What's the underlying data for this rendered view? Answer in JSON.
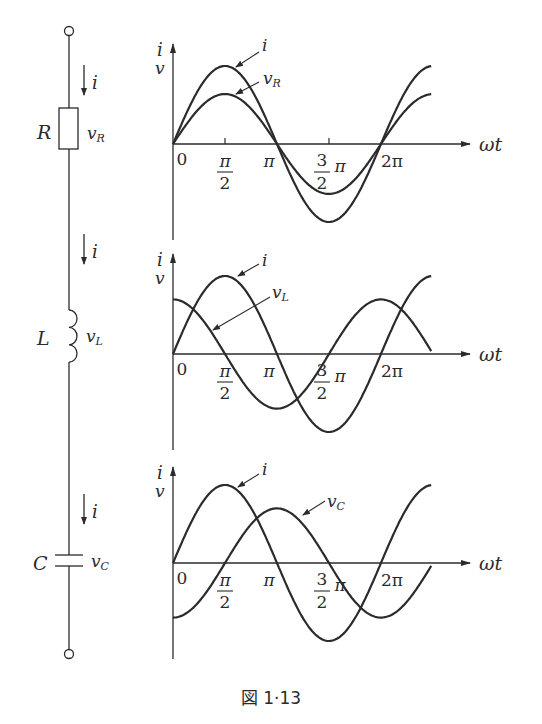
{
  "figure": {
    "caption": "図 1·13",
    "colors": {
      "ink": "#2b2b2b",
      "background": "#ffffff"
    }
  },
  "circuit": {
    "current_label": "i",
    "components": [
      {
        "type": "resistor",
        "name": "R",
        "voltage": "vR",
        "name_label": "R",
        "volt_main": "v",
        "volt_sub": "R"
      },
      {
        "type": "inductor",
        "name": "L",
        "voltage": "vL",
        "name_label": "L",
        "volt_main": "v",
        "volt_sub": "L"
      },
      {
        "type": "capacitor",
        "name": "C",
        "voltage": "vC",
        "name_label": "C",
        "volt_main": "v",
        "volt_sub": "C"
      }
    ]
  },
  "axes": {
    "y_label_top": "i",
    "y_label_bottom": "v",
    "x_label": "ωt",
    "origin": "0",
    "pi": "π",
    "two": "2",
    "three": "3",
    "two_pi": "2π"
  },
  "chart_data": [
    {
      "type": "line",
      "title": "R: i and vR in phase",
      "xlabel": "ωt",
      "ylabel": "i, v",
      "x_ticks": [
        "0",
        "π/2",
        "π",
        "3/2 π",
        "2π"
      ],
      "x_range_rad": [
        0,
        7.8
      ],
      "series": [
        {
          "name": "i",
          "label_main": "i",
          "label_sub": "",
          "function": "sin(ωt)",
          "amplitude": 1.0,
          "phase_deg": 0
        },
        {
          "name": "vR",
          "label_main": "v",
          "label_sub": "R",
          "function": "sin(ωt)",
          "amplitude": 0.64,
          "phase_deg": 0
        }
      ]
    },
    {
      "type": "line",
      "title": "L: vL leads i by π/2",
      "xlabel": "ωt",
      "ylabel": "i, v",
      "x_ticks": [
        "0",
        "π/2",
        "π",
        "3/2 π",
        "2π"
      ],
      "x_range_rad": [
        0,
        7.8
      ],
      "series": [
        {
          "name": "i",
          "label_main": "i",
          "label_sub": "",
          "function": "sin(ωt)",
          "amplitude": 1.0,
          "phase_deg": 0
        },
        {
          "name": "vL",
          "label_main": "v",
          "label_sub": "L",
          "function": "cos(ωt)",
          "amplitude": 0.7,
          "phase_deg": 90
        }
      ]
    },
    {
      "type": "line",
      "title": "C: vC lags i by π/2",
      "xlabel": "ωt",
      "ylabel": "i, v",
      "x_ticks": [
        "0",
        "π/2",
        "π",
        "3/2 π",
        "2π"
      ],
      "x_range_rad": [
        0,
        7.8
      ],
      "series": [
        {
          "name": "i",
          "label_main": "i",
          "label_sub": "",
          "function": "sin(ωt)",
          "amplitude": 1.0,
          "phase_deg": 0
        },
        {
          "name": "vC",
          "label_main": "v",
          "label_sub": "C",
          "function": "-cos(ωt)",
          "amplitude": 0.7,
          "phase_deg": -90
        }
      ]
    }
  ]
}
